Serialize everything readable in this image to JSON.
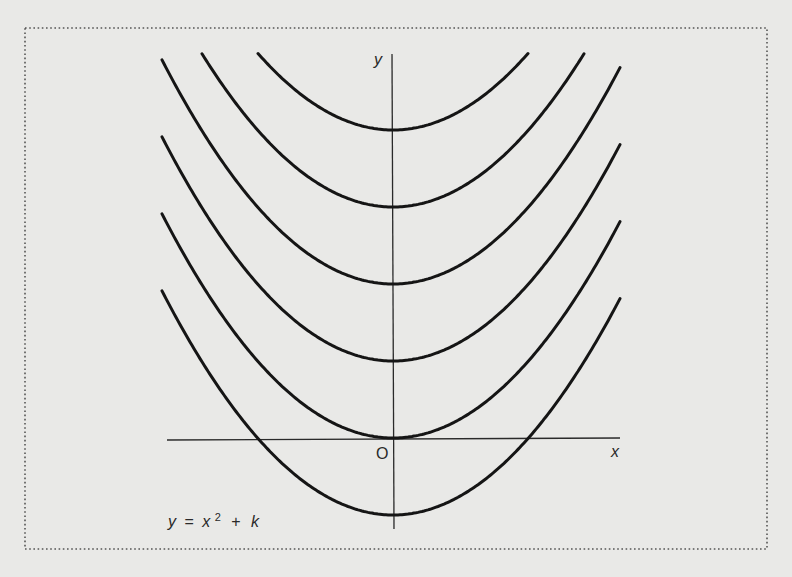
{
  "chart_data": {
    "type": "line",
    "equation": {
      "y": "y",
      "eq": "=",
      "x": "x",
      "exp": "2",
      "plus": "+",
      "k": "k"
    },
    "xlabel": "x",
    "ylabel": "y",
    "origin_label": "O",
    "grid": false,
    "legend": null,
    "series": [
      {
        "name": "k = 4",
        "k": 4
      },
      {
        "name": "k = 3",
        "k": 3
      },
      {
        "name": "k = 2",
        "k": 2
      },
      {
        "name": "k = 1",
        "k": 1
      },
      {
        "name": "k = 0",
        "k": 0
      },
      {
        "name": "k = -1",
        "k": -1
      }
    ],
    "colors": {
      "curve": "#151515",
      "axis": "#2a2a2a",
      "background": "#e9e9e7",
      "frame": "#555555"
    }
  }
}
